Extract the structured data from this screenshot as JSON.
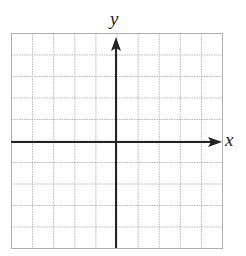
{
  "chart_data": {
    "type": "coordinate-grid",
    "title": "",
    "xlabel": "x",
    "ylabel": "y",
    "grid": true,
    "grid_cells": {
      "columns": 10,
      "rows": 10
    },
    "x_range": [
      -5,
      5
    ],
    "y_range": [
      -5,
      5
    ],
    "tick_labels": [],
    "data_points": [],
    "colors": {
      "grid": "#b5b5b5",
      "axis": "#222222",
      "background": "#ffffff"
    }
  },
  "labels": {
    "x_axis": "x",
    "y_axis": "y"
  }
}
